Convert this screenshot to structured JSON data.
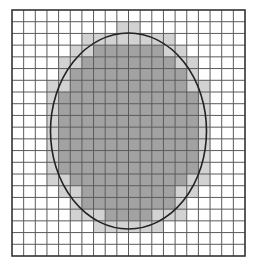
{
  "diagram": {
    "type": "grid-area-estimation",
    "grid": {
      "columns": 20,
      "rows": 21,
      "left": 12,
      "top": 10,
      "right": 245,
      "bottom": 256,
      "line_color": "#5a5a5a",
      "border_color": "#333333",
      "background": "#ffffff"
    },
    "ellipse": {
      "cx": 128.5,
      "cy": 131,
      "rx": 78,
      "ry": 98,
      "stroke": "#222222",
      "stroke_width": 1.6
    },
    "fills": {
      "full_inside": "#a2a2a2",
      "partial": "#d2d2d2"
    }
  }
}
